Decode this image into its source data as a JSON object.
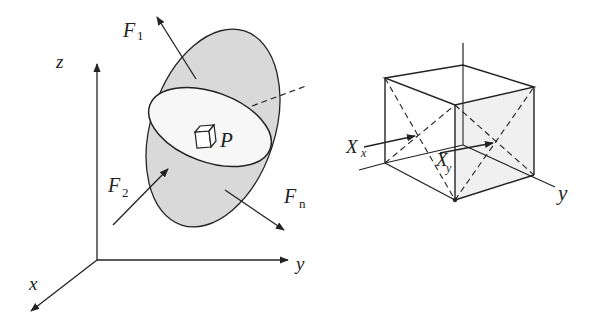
{
  "left_figure": {
    "axes": {
      "x": "x",
      "y": "y",
      "z": "z"
    },
    "forces": [
      {
        "symbol": "F",
        "subscript": "1"
      },
      {
        "symbol": "F",
        "subscript": "2"
      },
      {
        "symbol": "F",
        "subscript": "n"
      }
    ],
    "point": "P",
    "colors": {
      "surface_fill": "#d9d9d9",
      "section_fill": "#f7f7f7",
      "stroke": "#222222"
    }
  },
  "right_figure": {
    "labels": [
      {
        "symbol": "X",
        "subscript": "x"
      },
      {
        "symbol": "X",
        "subscript": "y"
      }
    ],
    "axis_label": "y",
    "colors": {
      "face_fill": "#f0f0f0",
      "stroke": "#222222"
    }
  }
}
